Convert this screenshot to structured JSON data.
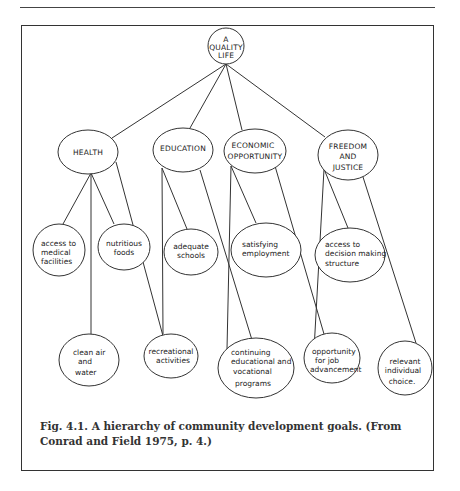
{
  "figure": {
    "root": {
      "id": "quality-life",
      "lines": [
        "A",
        "QUALITY",
        "LIFE"
      ]
    },
    "categories": [
      {
        "id": "health",
        "lines": [
          "HEALTH"
        ]
      },
      {
        "id": "education",
        "lines": [
          "EDUCATION"
        ]
      },
      {
        "id": "economic-opportunity",
        "lines": [
          "ECONOMIC",
          "OPPORTUNITY"
        ]
      },
      {
        "id": "freedom-justice",
        "lines": [
          "FREEDOM",
          "AND",
          "JUSTICE"
        ]
      }
    ],
    "goals_upper": [
      {
        "id": "medical-facilities",
        "parent": "health",
        "lines": [
          "access to",
          "medical",
          "facilities"
        ]
      },
      {
        "id": "nutritious-foods",
        "parent": "health",
        "lines": [
          "nutritious",
          "foods"
        ]
      },
      {
        "id": "adequate-schools",
        "parent": "education",
        "lines": [
          "adequate",
          "schools"
        ]
      },
      {
        "id": "satisfying-employment",
        "parent": "economic-opportunity",
        "lines": [
          "satisfying",
          "employment"
        ]
      },
      {
        "id": "decision-making",
        "parent": "freedom-justice",
        "lines": [
          "access to",
          "decision making",
          "structure"
        ]
      }
    ],
    "goals_lower": [
      {
        "id": "clean-air-water",
        "parent": "health",
        "lines": [
          "clean air",
          "and",
          "water"
        ]
      },
      {
        "id": "recreational-activities",
        "parent": "education",
        "lines": [
          "recreational",
          "activities"
        ]
      },
      {
        "id": "continuing-education",
        "parent": "education, economic-opportunity",
        "lines": [
          "continuing",
          "educational and",
          "vocational",
          "programs"
        ]
      },
      {
        "id": "job-advancement",
        "parent": "economic-opportunity, freedom-justice",
        "lines": [
          "opportunity",
          "for job",
          "advancement"
        ]
      },
      {
        "id": "individual-choice",
        "parent": "freedom-justice",
        "lines": [
          "relevant",
          "individual",
          "choice."
        ]
      }
    ]
  },
  "caption": {
    "line1": "Fig. 4.1.   A hierarchy of community development goals. (From",
    "line2": "Conrad and Field 1975, p. 4.)"
  }
}
